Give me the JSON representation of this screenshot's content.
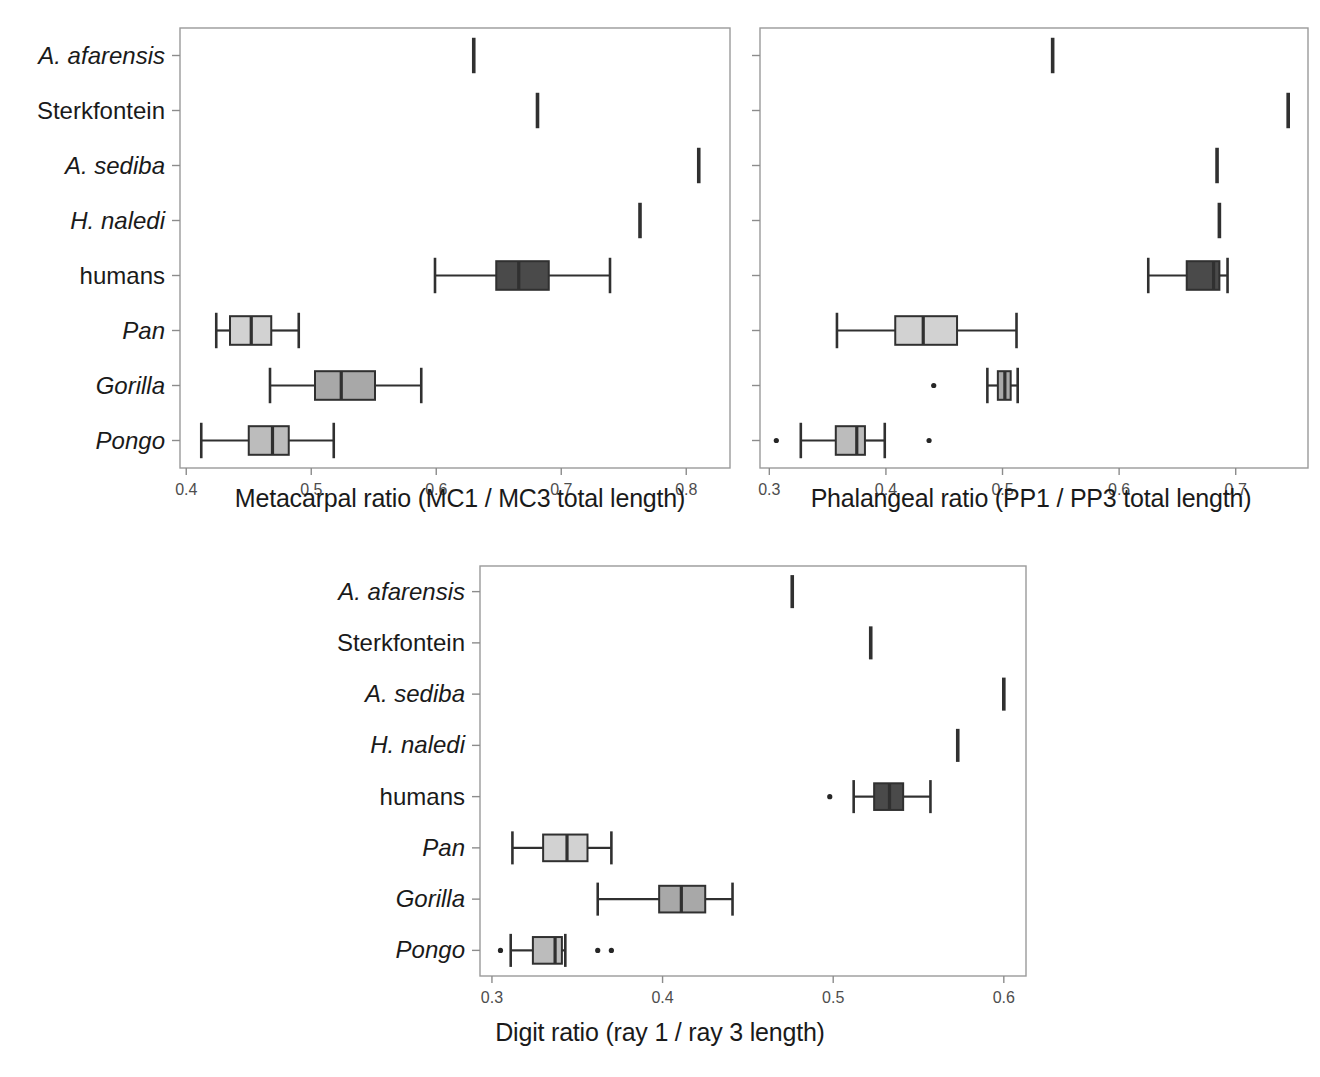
{
  "figure": {
    "categories": [
      "A. afarensis",
      "Sterkfontein",
      "A. sediba",
      "H. naledi",
      "humans",
      "Pan",
      "Gorilla",
      "Pongo"
    ],
    "categories_italic": [
      true,
      false,
      true,
      true,
      false,
      true,
      true,
      true
    ],
    "colors": {
      "humans_box": "#4a4a4a",
      "pan_box": "#d2d2d2",
      "gorilla_box": "#a8a8a8",
      "pongo_box": "#bcbcbc",
      "line": "#303030",
      "frame": "#9a9a9a",
      "tick_label": "#4d4d4d"
    }
  },
  "chart_data": [
    {
      "type": "box",
      "id": "metacarpal",
      "title": "",
      "xlabel": "Metacarpal ratio (MC1 / MC3 total length)",
      "ylabel": "",
      "xlim": [
        0.395,
        0.835
      ],
      "xticks": [
        0.4,
        0.5,
        0.6,
        0.7,
        0.8
      ],
      "xticklabels": [
        "0.4",
        "0.5",
        "0.6",
        "0.7",
        "0.8"
      ],
      "grid": false,
      "legend": "none",
      "categories": [
        "A. afarensis",
        "Sterkfontein",
        "A. sediba",
        "H. naledi",
        "humans",
        "Pan",
        "Gorilla",
        "Pongo"
      ],
      "boxes": [
        {
          "name": "A. afarensis",
          "kind": "single",
          "value": 0.63
        },
        {
          "name": "Sterkfontein",
          "kind": "single",
          "value": 0.681
        },
        {
          "name": "A. sediba",
          "kind": "single",
          "value": 0.81
        },
        {
          "name": "H. naledi",
          "kind": "single",
          "value": 0.763
        },
        {
          "name": "humans",
          "kind": "box",
          "whisker_low": 0.599,
          "q1": 0.648,
          "median": 0.666,
          "q3": 0.69,
          "whisker_high": 0.739,
          "fill": "#4a4a4a",
          "outliers": []
        },
        {
          "name": "Pan",
          "kind": "box",
          "whisker_low": 0.424,
          "q1": 0.435,
          "median": 0.452,
          "q3": 0.468,
          "whisker_high": 0.49,
          "fill": "#d2d2d2",
          "outliers": []
        },
        {
          "name": "Gorilla",
          "kind": "box",
          "whisker_low": 0.467,
          "q1": 0.503,
          "median": 0.524,
          "q3": 0.551,
          "whisker_high": 0.588,
          "fill": "#a8a8a8",
          "outliers": []
        },
        {
          "name": "Pongo",
          "kind": "box",
          "whisker_low": 0.412,
          "q1": 0.45,
          "median": 0.469,
          "q3": 0.482,
          "whisker_high": 0.518,
          "fill": "#bcbcbc",
          "outliers": []
        }
      ]
    },
    {
      "type": "box",
      "id": "phalangeal",
      "title": "",
      "xlabel": "Phalangeal ratio (PP1 / PP3 total length)",
      "ylabel": "",
      "xlim": [
        0.292,
        0.762
      ],
      "xticks": [
        0.3,
        0.4,
        0.5,
        0.6,
        0.7
      ],
      "xticklabels": [
        "0.3",
        "0.4",
        "0.5",
        "0.6",
        "0.7"
      ],
      "grid": false,
      "legend": "none",
      "categories": [
        "A. afarensis",
        "Sterkfontein",
        "A. sediba",
        "H. naledi",
        "humans",
        "Pan",
        "Gorilla",
        "Pongo"
      ],
      "boxes": [
        {
          "name": "A. afarensis",
          "kind": "single",
          "value": 0.543
        },
        {
          "name": "Sterkfontein",
          "kind": "single",
          "value": 0.745
        },
        {
          "name": "A. sediba",
          "kind": "single",
          "value": 0.684
        },
        {
          "name": "H. naledi",
          "kind": "single",
          "value": 0.686
        },
        {
          "name": "humans",
          "kind": "box",
          "whisker_low": 0.625,
          "q1": 0.658,
          "median": 0.681,
          "q3": 0.686,
          "whisker_high": 0.693,
          "fill": "#4a4a4a",
          "outliers": []
        },
        {
          "name": "Pan",
          "kind": "box",
          "whisker_low": 0.358,
          "q1": 0.408,
          "median": 0.432,
          "q3": 0.461,
          "whisker_high": 0.512,
          "fill": "#d2d2d2",
          "outliers": []
        },
        {
          "name": "Gorilla",
          "kind": "box",
          "whisker_low": 0.487,
          "q1": 0.496,
          "median": 0.502,
          "q3": 0.507,
          "whisker_high": 0.513,
          "fill": "#a8a8a8",
          "outliers": [
            0.441
          ]
        },
        {
          "name": "Pongo",
          "kind": "box",
          "whisker_low": 0.327,
          "q1": 0.357,
          "median": 0.375,
          "q3": 0.382,
          "whisker_high": 0.399,
          "fill": "#bcbcbc",
          "outliers": [
            0.306,
            0.437
          ]
        }
      ]
    },
    {
      "type": "box",
      "id": "digit",
      "title": "",
      "xlabel": "Digit ratio (ray 1 / ray 3 length)",
      "ylabel": "",
      "xlim": [
        0.293,
        0.613
      ],
      "xticks": [
        0.3,
        0.4,
        0.5,
        0.6
      ],
      "xticklabels": [
        "0.3",
        "0.4",
        "0.5",
        "0.6"
      ],
      "grid": false,
      "legend": "none",
      "categories": [
        "A. afarensis",
        "Sterkfontein",
        "A. sediba",
        "H. naledi",
        "humans",
        "Pan",
        "Gorilla",
        "Pongo"
      ],
      "boxes": [
        {
          "name": "A. afarensis",
          "kind": "single",
          "value": 0.476
        },
        {
          "name": "Sterkfontein",
          "kind": "single",
          "value": 0.522
        },
        {
          "name": "A. sediba",
          "kind": "single",
          "value": 0.6
        },
        {
          "name": "H. naledi",
          "kind": "single",
          "value": 0.573
        },
        {
          "name": "humans",
          "kind": "box",
          "whisker_low": 0.512,
          "q1": 0.524,
          "median": 0.533,
          "q3": 0.541,
          "whisker_high": 0.557,
          "fill": "#4a4a4a",
          "outliers": [
            0.498
          ]
        },
        {
          "name": "Pan",
          "kind": "box",
          "whisker_low": 0.312,
          "q1": 0.33,
          "median": 0.344,
          "q3": 0.356,
          "whisker_high": 0.37,
          "fill": "#d2d2d2",
          "outliers": []
        },
        {
          "name": "Gorilla",
          "kind": "box",
          "whisker_low": 0.362,
          "q1": 0.398,
          "median": 0.411,
          "q3": 0.425,
          "whisker_high": 0.441,
          "fill": "#a8a8a8",
          "outliers": []
        },
        {
          "name": "Pongo",
          "kind": "box",
          "whisker_low": 0.311,
          "q1": 0.324,
          "median": 0.337,
          "q3": 0.341,
          "whisker_high": 0.343,
          "fill": "#bcbcbc",
          "outliers": [
            0.305,
            0.362,
            0.37
          ]
        }
      ]
    }
  ]
}
